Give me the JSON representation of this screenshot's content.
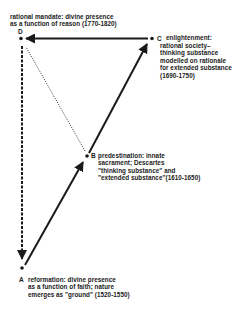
{
  "diagram": {
    "nodes": {
      "D": {
        "letter": "D",
        "lines": [
          "rational mandate: divine presence",
          "as a function of reason (1770-1820)"
        ]
      },
      "C": {
        "letter": "C",
        "lines": [
          "enlightenment:",
          "rational society–",
          "thinking substance",
          "modelled on rationale",
          "for extended substance",
          "(1690-1750)"
        ]
      },
      "B": {
        "letter": "B",
        "lines": [
          "predestination: innate",
          "sacrament; Descartes",
          "\"thinking substance\" and",
          "\"extended substance\"(1610-1650)"
        ]
      },
      "A": {
        "letter": "A",
        "lines": [
          "reformation: divine presence",
          "as a function of faith; nature",
          "emerges as \"ground\" (1520-1550)"
        ]
      }
    },
    "edges": [
      {
        "from": "A",
        "to": "B",
        "style": "solid"
      },
      {
        "from": "B",
        "to": "C",
        "style": "solid"
      },
      {
        "from": "C",
        "to": "D",
        "style": "solid"
      },
      {
        "from": "D",
        "to": "A",
        "style": "dashed"
      },
      {
        "from": "B",
        "to": "D",
        "style": "dotted"
      }
    ],
    "ink_color": "#1a1a1a",
    "background": "#ffffff"
  }
}
